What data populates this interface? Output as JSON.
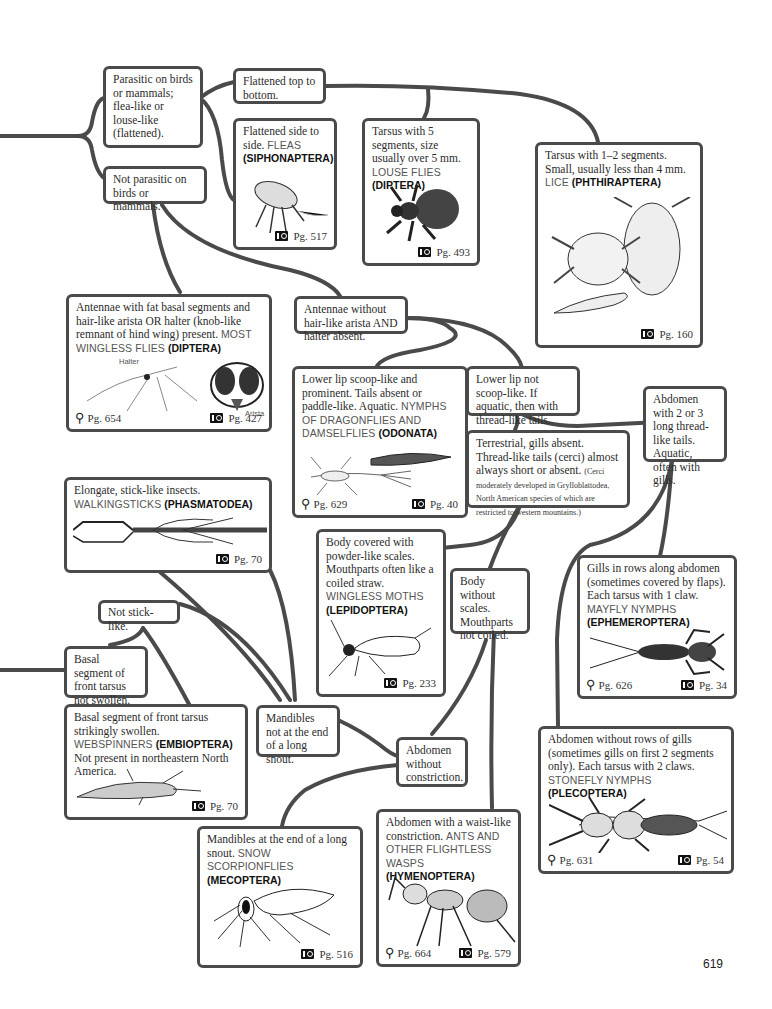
{
  "page_number": "619",
  "colors": {
    "connector": "#4a4a4a",
    "box_border": "#4a4a4a",
    "common_name": "#555555",
    "order_name": "#111111"
  },
  "icons": {
    "photo_ref": "camera-icon",
    "key_ref": "key-icon"
  },
  "nodes": {
    "parasitic": {
      "text": "Parasitic on birds or mammals; flea-like or louse-like (flattened)."
    },
    "not_parasitic": {
      "text": "Not parasitic on birds or mammals."
    },
    "flat_top": {
      "text": "Flattened top to bottom."
    },
    "fleas": {
      "text": "Flattened side to side.",
      "common": "FLEAS",
      "order": "(SIPHONAPTERA)",
      "photo_page": "Pg. 517"
    },
    "louse_flies": {
      "text": "Tarsus with 5 segments, size usually over 5 mm.",
      "common": "LOUSE FLIES",
      "order": "(DIPTERA)",
      "photo_page": "Pg. 493"
    },
    "lice": {
      "text": "Tarsus with 1–2 segments. Small, usually less than 4 mm.",
      "common": "LICE",
      "order": "(PHTHIRAPTERA)",
      "photo_page": "Pg. 160"
    },
    "wingless_flies": {
      "text": "Antennae with fat basal segments and hair-like arista OR halter (knob-like remnant of hind wing) present.",
      "common": "MOST WINGLESS FLIES",
      "order": "(DIPTERA)",
      "key_page": "Pg. 654",
      "photo_page": "Pg. 427",
      "labels": [
        "Halter",
        "Arista"
      ]
    },
    "antennae_without": {
      "text": "Antennae without hair-like arista AND halter absent."
    },
    "odonata": {
      "text": "Lower lip scoop-like and prominent. Tails absent or paddle-like. Aquatic.",
      "common": "NYMPHS OF DRAGONFLIES AND DAMSELFLIES",
      "order": "(ODONATA)",
      "key_page": "Pg. 629",
      "photo_page": "Pg. 40"
    },
    "lower_lip_not": {
      "text": "Lower lip not scoop-like. If aquatic, then with thread-like tails."
    },
    "abdomen_tails": {
      "text": "Abdomen with 2 or 3 long thread-like tails. Aquatic, often with gills."
    },
    "terrestrial": {
      "text": "Terrestrial, gills absent. Thread-like tails (cerci) almost always short or absent.",
      "note": "(Cerci moderately developed in Grylloblattodea, North American species of which are restricted to western mountains.)"
    },
    "walkingsticks": {
      "text": "Elongate, stick-like insects.",
      "common": "WALKINGSTICKS",
      "order": "(PHASMATODEA)",
      "photo_page": "Pg. 70"
    },
    "moths": {
      "text": "Body covered with powder-like scales. Mouthparts often like a coiled straw.",
      "common": "WINGLESS MOTHS",
      "order": "(LEPIDOPTERA)",
      "photo_page": "Pg. 233"
    },
    "body_without_scales": {
      "text": "Body without scales. Mouthparts not coiled."
    },
    "mayfly": {
      "text": "Gills in rows along abdomen (sometimes covered by flaps). Each tarsus with 1 claw.",
      "common": "MAYFLY NYMPHS",
      "order": "(EPHEMEROPTERA)",
      "key_page": "Pg. 626",
      "photo_page": "Pg. 34"
    },
    "not_stick": {
      "text": "Not stick-like."
    },
    "basal_not_swollen": {
      "text": "Basal segment of front tarsus not swollen."
    },
    "webspinners": {
      "text": "Basal segment of front tarsus strikingly swollen.",
      "common": "WEBSPINNERS",
      "order": "(EMBIOPTERA)",
      "extra": "Not present in northeastern North America.",
      "photo_page": "Pg. 70"
    },
    "mandibles_not": {
      "text": "Mandibles not at the end of a long snout."
    },
    "abdomen_without_constriction": {
      "text": "Abdomen without constriction."
    },
    "stonefly": {
      "text": "Abdomen without rows of gills (sometimes gills on first 2 segments only). Each tarsus with 2 claws.",
      "common": "STONEFLY NYMPHS",
      "order": "(PLECOPTERA)",
      "key_page": "Pg. 631",
      "photo_page": "Pg. 54"
    },
    "mecoptera": {
      "text": "Mandibles at the end of a long snout.",
      "common": "SNOW SCORPIONFLIES",
      "order": "(MECOPTERA)",
      "photo_page": "Pg. 516"
    },
    "hymenoptera": {
      "text": "Abdomen with a waist-like constriction.",
      "common": "ANTS AND OTHER FLIGHTLESS WASPS",
      "order": "(HYMENOPTERA)",
      "key_page": "Pg. 664",
      "photo_page": "Pg. 579"
    }
  }
}
